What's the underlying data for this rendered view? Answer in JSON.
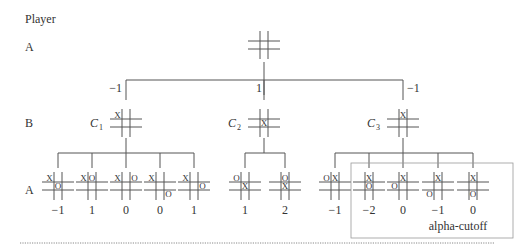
{
  "header": {
    "player_label": "Player"
  },
  "levels": [
    {
      "player": "A",
      "y": 47
    },
    {
      "player": "B",
      "y": 123
    },
    {
      "player": "A",
      "y": 190
    }
  ],
  "root": {
    "x": 264,
    "y": 45,
    "cells": [
      "",
      "",
      "",
      "",
      "",
      "",
      "",
      "",
      ""
    ]
  },
  "children": [
    {
      "name": "C",
      "sub": "1",
      "value": "−1",
      "x": 126,
      "cells": [
        "X",
        "",
        "",
        "",
        "",
        "",
        "",
        "",
        ""
      ]
    },
    {
      "name": "C",
      "sub": "2",
      "value": "1",
      "x": 264,
      "cells": [
        "",
        "",
        "",
        "",
        "X",
        "",
        "",
        "",
        ""
      ]
    },
    {
      "name": "C",
      "sub": "3",
      "value": "−1",
      "x": 403,
      "cells": [
        "",
        "X",
        "",
        "",
        "",
        "",
        "",
        "",
        ""
      ]
    }
  ],
  "leaves": [
    {
      "parent": 0,
      "x": 58,
      "value": "−1",
      "cells": [
        "X",
        "",
        "",
        "",
        "O",
        "",
        "",
        "",
        ""
      ]
    },
    {
      "parent": 0,
      "x": 92,
      "value": "1",
      "cells": [
        "X",
        "O",
        "",
        "",
        "",
        "",
        "",
        "",
        ""
      ]
    },
    {
      "parent": 0,
      "x": 126,
      "value": "0",
      "cells": [
        "X",
        "",
        "O",
        "",
        "",
        "",
        "",
        "",
        ""
      ]
    },
    {
      "parent": 0,
      "x": 160,
      "value": "0",
      "cells": [
        "X",
        "",
        "",
        "",
        "",
        "",
        "",
        "",
        "O"
      ]
    },
    {
      "parent": 0,
      "x": 194,
      "value": "1",
      "cells": [
        "X",
        "",
        "",
        "",
        "",
        "O",
        "",
        "",
        ""
      ]
    },
    {
      "parent": 1,
      "x": 245,
      "value": "1",
      "cells": [
        "O",
        "",
        "",
        "",
        "X",
        "",
        "",
        "",
        ""
      ]
    },
    {
      "parent": 1,
      "x": 285,
      "value": "2",
      "cells": [
        "",
        "O",
        "",
        "",
        "X",
        "",
        "",
        "",
        ""
      ]
    },
    {
      "parent": 2,
      "x": 335,
      "value": "−1",
      "cells": [
        "O",
        "X",
        "",
        "",
        "",
        "",
        "",
        "",
        ""
      ]
    },
    {
      "parent": 2,
      "x": 369,
      "value": "−2",
      "cells": [
        "",
        "X",
        "",
        "",
        "O",
        "",
        "",
        "",
        ""
      ]
    },
    {
      "parent": 2,
      "x": 403,
      "value": "0",
      "cells": [
        "",
        "X",
        "",
        "O",
        "",
        "",
        "",
        "",
        ""
      ]
    },
    {
      "parent": 2,
      "x": 438,
      "value": "−1",
      "cells": [
        "",
        "X",
        "",
        "",
        "",
        "",
        "O",
        "",
        ""
      ]
    },
    {
      "parent": 2,
      "x": 473,
      "value": "0",
      "cells": [
        "",
        "X",
        "",
        "",
        "",
        "",
        "",
        "O",
        ""
      ]
    }
  ],
  "cutoff": {
    "label": "alpha-cutoff"
  },
  "colors": {
    "line": "#555555",
    "text": "#333333",
    "dotted": "#888888"
  }
}
